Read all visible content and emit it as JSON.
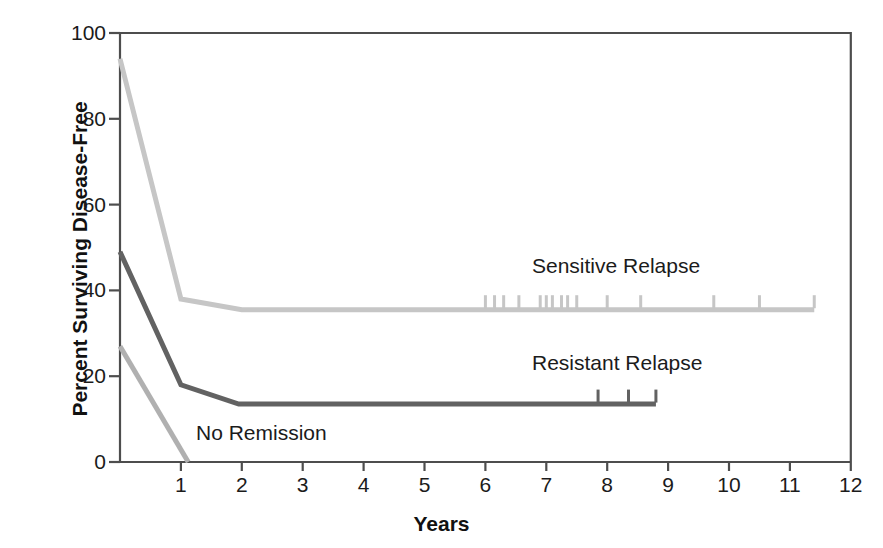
{
  "figure": {
    "background_color": "#ffffff",
    "title": ""
  },
  "axes": {
    "x_title": "Years",
    "y_title": "Percent Surviving Disease-Free",
    "x_ticks": [
      "1",
      "2",
      "3",
      "4",
      "5",
      "6",
      "7",
      "8",
      "9",
      "10",
      "11",
      "12"
    ],
    "y_ticks": [
      "0",
      "20",
      "40",
      "60",
      "80",
      "100"
    ]
  },
  "labels": {
    "sensitive": "Sensitive Relapse",
    "resistant": "Resistant Relapse",
    "no_remission": "No Remission"
  },
  "colors": {
    "sensitive": "#c6c6c6",
    "resistant": "#626262",
    "no_remission": "#b0b0b0",
    "frame": "#4d4d4d",
    "text": "#1b1b1b"
  },
  "chart_data": {
    "type": "line",
    "title": "",
    "subtitle": "",
    "xlabel": "Years",
    "ylabel": "Percent Surviving Disease-Free",
    "xlim": [
      0,
      12
    ],
    "ylim": [
      0,
      100
    ],
    "xticks": [
      1,
      2,
      3,
      4,
      5,
      6,
      7,
      8,
      9,
      10,
      11,
      12
    ],
    "yticks": [
      0,
      20,
      40,
      60,
      80,
      100
    ],
    "grid": false,
    "legend_position": "inline-annotation",
    "series": [
      {
        "name": "Sensitive Relapse",
        "color": "#c6c6c6",
        "points": [
          [
            0.0,
            94
          ],
          [
            1.0,
            38
          ],
          [
            2.0,
            35.5
          ],
          [
            11.4,
            35.5
          ]
        ],
        "censor_marks": [
          6.0,
          6.15,
          6.3,
          6.55,
          6.9,
          7.0,
          7.1,
          7.25,
          7.35,
          7.5,
          8.0,
          8.55,
          9.75,
          10.5,
          11.4
        ]
      },
      {
        "name": "Resistant Relapse",
        "color": "#626262",
        "points": [
          [
            0.0,
            49
          ],
          [
            1.0,
            18
          ],
          [
            1.95,
            13.5
          ],
          [
            8.8,
            13.5
          ]
        ],
        "censor_marks": [
          7.85,
          8.35,
          8.8
        ]
      },
      {
        "name": "No Remission",
        "color": "#b0b0b0",
        "points": [
          [
            0.0,
            27
          ],
          [
            1.12,
            0
          ]
        ],
        "censor_marks": []
      }
    ],
    "annotations": [
      {
        "text": "Sensitive Relapse",
        "x": 7.2,
        "y": 42
      },
      {
        "text": "Resistant Relapse",
        "x": 9.0,
        "y": 22
      },
      {
        "text": "No Remission",
        "x": 2.0,
        "y": 5
      }
    ]
  }
}
